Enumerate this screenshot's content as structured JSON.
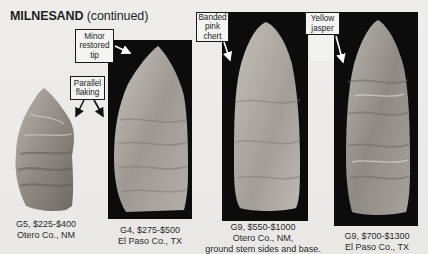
{
  "header": {
    "title_bold": "MILNESAND",
    "title_rest": " (continued)"
  },
  "points": [
    {
      "grade_price": "G5, $225-$400",
      "location": "Otero Co., NM",
      "note": ""
    },
    {
      "grade_price": "G4, $275-$500",
      "location": "El Paso Co., TX",
      "note": ""
    },
    {
      "grade_price": "G9, $550-$1000",
      "location": "Otero Co., NM,",
      "note": "ground stem sides and base."
    },
    {
      "grade_price": "G9, $700-$1300",
      "location": "El Paso Co., TX",
      "note": ""
    }
  ],
  "callouts": {
    "restored_tip": [
      "Minor",
      "restored",
      "tip"
    ],
    "parallel_flaking": [
      "Parallel",
      "flaking"
    ],
    "banded_chert": [
      "Banded",
      "pink",
      "chert"
    ],
    "yellow_jasper": [
      "Yellow",
      "jasper"
    ]
  },
  "colors": {
    "page_bg": "#ecebe8",
    "photo_bg": "#0c0c0c",
    "text": "#1e1e1e"
  }
}
